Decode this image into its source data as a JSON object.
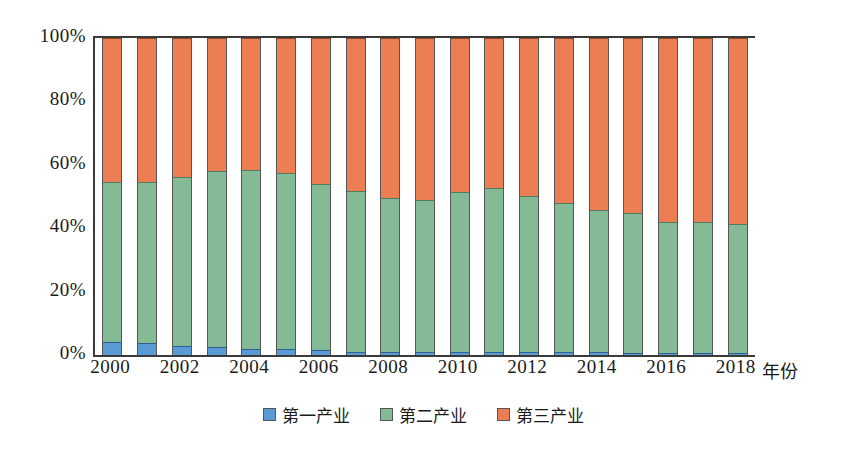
{
  "chart_data": {
    "type": "bar",
    "subtype": "stacked-100-percent",
    "title": "",
    "xlabel": "年份",
    "ylabel": "",
    "ylim": [
      0,
      100
    ],
    "yticks": [
      "0%",
      "20%",
      "40%",
      "60%",
      "80%",
      "100%"
    ],
    "ytick_values": [
      0,
      20,
      40,
      60,
      80,
      100
    ],
    "grid": false,
    "legend_position": "bottom-center",
    "categories": [
      "2000",
      "2001",
      "2002",
      "2003",
      "2004",
      "2005",
      "2006",
      "2007",
      "2008",
      "2009",
      "2010",
      "2011",
      "2012",
      "2013",
      "2014",
      "2015",
      "2016",
      "2017",
      "2018"
    ],
    "xtick_labels": [
      "2000",
      "2002",
      "2004",
      "2006",
      "2008",
      "2010",
      "2012",
      "2014",
      "2016",
      "2018"
    ],
    "series": [
      {
        "name": "第一产业",
        "color": "#5B9BD5",
        "values": [
          4.0,
          3.9,
          3.0,
          2.4,
          2.0,
          1.9,
          1.5,
          1.1,
          1.1,
          1.1,
          1.0,
          0.9,
          0.9,
          0.8,
          0.8,
          0.7,
          0.6,
          0.5,
          0.5
        ]
      },
      {
        "name": "第二产业",
        "color": "#85BA96",
        "values": [
          50.7,
          50.6,
          53.3,
          55.5,
          56.5,
          55.4,
          52.6,
          50.7,
          48.5,
          47.8,
          50.3,
          51.8,
          49.4,
          47.2,
          45.1,
          44.2,
          41.4,
          41.4,
          40.8
        ]
      },
      {
        "name": "第三产业",
        "color": "#ED7D52",
        "values": [
          45.3,
          45.5,
          43.7,
          42.1,
          41.5,
          42.7,
          45.9,
          48.2,
          50.4,
          51.1,
          48.7,
          47.3,
          49.7,
          52.0,
          54.1,
          55.1,
          58.0,
          58.1,
          58.7
        ]
      }
    ]
  },
  "legend": {
    "items": [
      {
        "label": "第一产业",
        "color": "#5B9BD5"
      },
      {
        "label": "第二产业",
        "color": "#85BA96"
      },
      {
        "label": "第三产业",
        "color": "#ED7D52"
      }
    ]
  },
  "axis": {
    "x_title": "年份"
  }
}
